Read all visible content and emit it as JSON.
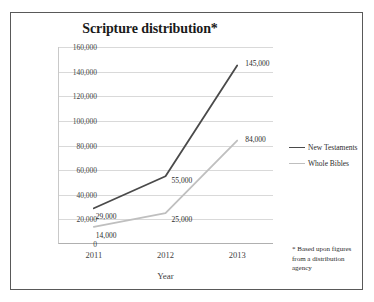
{
  "chart_data": {
    "type": "line",
    "title": "Scripture distribution*",
    "xlabel": "Year",
    "ylabel": "",
    "categories": [
      "2011",
      "2012",
      "2013"
    ],
    "ylim": [
      0,
      160000
    ],
    "ytick_labels": [
      "0",
      "20,000",
      "40,000",
      "60,000",
      "80,000",
      "100,000",
      "120,000",
      "140,000",
      "160,000"
    ],
    "ytick_values": [
      0,
      20000,
      40000,
      60000,
      80000,
      100000,
      120000,
      140000,
      160000
    ],
    "grid": true,
    "legend_position": "right",
    "series": [
      {
        "name": "New Testaments",
        "color": "#4a4a4a",
        "values": [
          29000,
          55000,
          145000
        ],
        "point_labels": [
          "29,000",
          "55,000",
          "145,000"
        ]
      },
      {
        "name": "Whole Bibles",
        "color": "#bfbfbf",
        "values": [
          14000,
          25000,
          84000
        ],
        "point_labels": [
          "14,000",
          "25,000",
          "84,000"
        ]
      }
    ],
    "annotation": "* Based upon figures from a distribution agency"
  },
  "footnote": {
    "line1": "* Based upon figures",
    "line2": "from a distribution",
    "line3": "agency"
  },
  "colors": {
    "new_testaments": "#4a4a4a",
    "whole_bibles": "#bfbfbf",
    "frame": "#595959",
    "gridline": "#d9d9d9"
  }
}
